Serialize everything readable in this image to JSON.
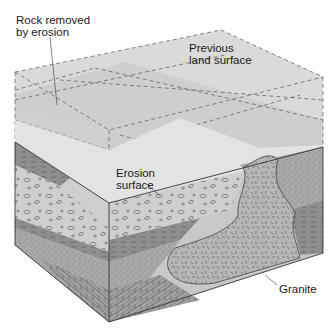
{
  "figure": {
    "type": "block-diagram"
  },
  "labels": {
    "rock_removed": "Rock removed\nby erosion",
    "previous_surface": "Previous\nland surface",
    "erosion_surface": "Erosion\nsurface",
    "granite": "Granite"
  },
  "colors": {
    "ghost_block": "#d8d8d8",
    "ghost_band_dark": "#c4c4c4",
    "erosion_surface": "#e6e6e6",
    "conglomerate": "#c9c9c9",
    "shale": "#8a8a8a",
    "sandstone": "#aaaaaa",
    "limestone": "#9d9d9d",
    "granite": "#b3b3b3",
    "outline": "#333333",
    "dash": "#6a6a6a"
  }
}
